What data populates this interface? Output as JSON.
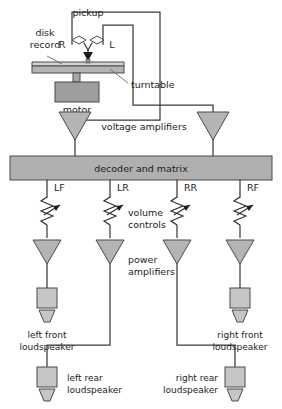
{
  "diagram": {
    "type": "block-diagram"
  },
  "colors": {
    "fill_mid": "#b4b4b4",
    "fill_light": "#cccccc",
    "fill_bar": "#b0b0b0",
    "stroke": "#4a4a4a",
    "wire": "#3b3b3b",
    "text": "#1c1c1c"
  },
  "labels": {
    "disk_record": "disk\nrecord",
    "disk_record_line1": "disk",
    "disk_record_line2": "record",
    "pickup": "pickup",
    "channel_r": "R",
    "channel_l": "L",
    "turntable": "turntable",
    "motor": "motor",
    "voltage_amplifiers": "voltage amplifiers",
    "decoder": "decoder and matrix",
    "volume_controls_line1": "volume",
    "volume_controls_line2": "controls",
    "power_amplifiers_line1": "power",
    "power_amplifiers_line2": "amplifiers",
    "left_front_line1": "left front",
    "left_front_line2": "loudspeaker",
    "right_front_line1": "right front",
    "right_front_line2": "loudspeaker",
    "left_rear_line1": "left rear",
    "left_rear_line2": "loudspeaker",
    "right_rear_line1": "right rear",
    "right_rear_line2": "loudspeaker"
  },
  "channels": [
    {
      "code": "LF",
      "name": "left front",
      "x": 47
    },
    {
      "code": "LR",
      "name": "left rear",
      "x": 110
    },
    {
      "code": "RR",
      "name": "right rear",
      "x": 177
    },
    {
      "code": "RF",
      "name": "right front",
      "x": 240
    }
  ],
  "blocks": {
    "decoder_label": "decoder and matrix",
    "voltage_amp_count": 2,
    "power_amp_count": 4,
    "loudspeaker_count": 4
  }
}
